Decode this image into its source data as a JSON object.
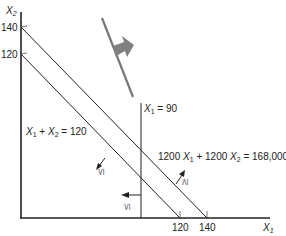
{
  "diagram": {
    "type": "linear-programming-feasible-region",
    "axes": {
      "x_label": "X",
      "x_label_sub": "1",
      "y_label": "X",
      "y_label_sub": "2",
      "x_ticks": [
        "120",
        "140"
      ],
      "y_ticks": [
        "140",
        "120"
      ]
    },
    "constraints": [
      {
        "id": "sum120",
        "label_parts": [
          "X",
          "1",
          " + ",
          "X",
          "2",
          " = 120"
        ],
        "inequality": "≤"
      },
      {
        "id": "cost",
        "label_parts": [
          "1200 ",
          "X",
          "1",
          " + 1200 ",
          "X",
          "2",
          " = 168,000"
        ],
        "inequality": "≥"
      },
      {
        "id": "x1limit",
        "label_parts": [
          "X",
          "1",
          " = 90"
        ],
        "inequality": "≤"
      }
    ],
    "objective_direction": "upper-right",
    "colors": {
      "line": "#222222",
      "objective_line": "#777777",
      "objective_arrow": "#808080",
      "inequality_symbol": "#777777"
    }
  }
}
